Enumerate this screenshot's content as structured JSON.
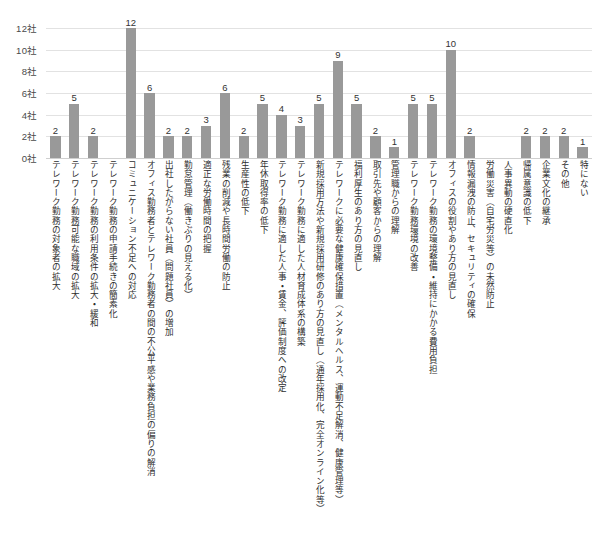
{
  "chart_data": {
    "type": "bar",
    "title": "",
    "subtitle": "",
    "xlabel": "",
    "ylabel": "",
    "unit_suffix": "社",
    "ylim": [
      0,
      12
    ],
    "y_ticks": [
      0,
      2,
      4,
      6,
      8,
      10,
      12
    ],
    "y_tick_labels": [
      "0社",
      "2社",
      "4社",
      "6社",
      "8社",
      "10社",
      "12社"
    ],
    "grid": true,
    "legend": false,
    "legend_position": "none",
    "bar_color": "#999999",
    "value_label_color": "#333333",
    "gridline_color": "#e2e2e2",
    "axis_color": "#cfcfcf",
    "categories": [
      "テレワーク勤務の対象者の拡大",
      "テレワーク勤務可能な職域の拡大",
      "テレワーク勤務の利用条件の拡大・緩和",
      "テレワーク勤務の申請手続きの簡素化",
      "コミュニケーション不足への対応",
      "オフィス勤務者とテレワーク勤務者の間の不公平感や業務負担の偏りの解消",
      "出社したがらない社員（問題社員）の増加",
      "勤怠管理（働きぶりの見える化）",
      "適正な労働時間の把握",
      "残業の削減や長時間労働の防止",
      "生産性の低下",
      "年休取得率の低下",
      "テレワーク勤務に適した人事・賃金、評価制度への改定",
      "テレワーク勤務に適した人材育成体系の構築",
      "新規採用方法や新規採用研修のあり方の見直し（通年採用化、完全オンライン化等）",
      "テレワークに必要な健康確保措置（メンタルヘルス、運動不足解消、健康管理等）",
      "福利厚生のあり方の見直し",
      "取引先や顧客からの理解",
      "管理職からの理解",
      "テレワーク勤務環境の改善",
      "テレワーク勤務の環境整備・維持にかかる費用負担",
      "オフィスの役割やあり方の見直し",
      "情報漏洩の防止、セキュリティの確保",
      "労働災害（自宅労災等）の未然防止",
      "人事異動の硬直化",
      "帰属意識の低下",
      "企業文化の継承",
      "その他",
      "特にない"
    ],
    "values": [
      2,
      5,
      2,
      0,
      12,
      6,
      2,
      2,
      3,
      6,
      2,
      5,
      4,
      3,
      5,
      9,
      5,
      2,
      1,
      5,
      5,
      10,
      2,
      0,
      0,
      2,
      2,
      2,
      1
    ]
  }
}
